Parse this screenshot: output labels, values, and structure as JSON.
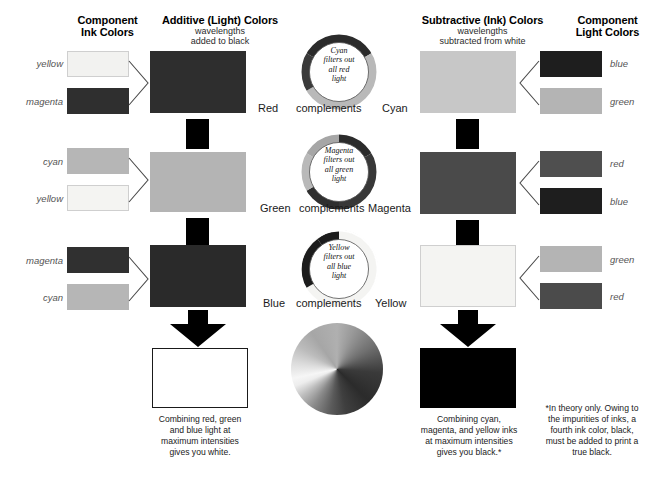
{
  "diagram": {
    "note": "grayscale reproduction"
  },
  "headers": {
    "left_col": {
      "line1": "Component",
      "line2": "Ink Colors"
    },
    "additive": {
      "line1": "Additive (Light) Colors",
      "line2": "wavelengths",
      "line3": "added to black"
    },
    "subtractive": {
      "line1": "Subtractive (Ink) Colors",
      "line2": "wavelengths",
      "line3": "subtracted from white"
    },
    "right_col": {
      "line1": "Component",
      "line2": "Light Colors"
    }
  },
  "left_groups": [
    {
      "name": "red-group",
      "inputs": [
        {
          "label": "yellow",
          "hex": "#f2f2f0"
        },
        {
          "label": "magenta",
          "hex": "#2f2f2f"
        }
      ],
      "result": {
        "label": "Red",
        "hex": "#2e2e2e"
      }
    },
    {
      "name": "green-group",
      "inputs": [
        {
          "label": "cyan",
          "hex": "#b6b6b6"
        },
        {
          "label": "yellow",
          "hex": "#f4f4f2"
        }
      ],
      "result": {
        "label": "Green",
        "hex": "#b4b4b4"
      }
    },
    {
      "name": "blue-group",
      "inputs": [
        {
          "label": "magenta",
          "hex": "#303030"
        },
        {
          "label": "cyan",
          "hex": "#b6b6b6"
        }
      ],
      "result": {
        "label": "Blue",
        "hex": "#2a2a2a"
      }
    }
  ],
  "right_groups": [
    {
      "name": "cyan-group",
      "result": {
        "label": "Cyan",
        "hex": "#c7c7c7"
      },
      "outputs": [
        {
          "label": "blue",
          "hex": "#1e1e1e"
        },
        {
          "label": "green",
          "hex": "#b4b4b4"
        }
      ]
    },
    {
      "name": "magenta-group",
      "result": {
        "label": "Magenta",
        "hex": "#4a4a4a"
      },
      "outputs": [
        {
          "label": "red",
          "hex": "#4f4f4f"
        },
        {
          "label": "blue",
          "hex": "#1e1e1e"
        }
      ]
    },
    {
      "name": "yellow-group",
      "result": {
        "label": "Yellow",
        "hex": "#f4f4f2"
      },
      "outputs": [
        {
          "label": "green",
          "hex": "#b4b4b4"
        },
        {
          "label": "red",
          "hex": "#4b4b4b"
        }
      ]
    }
  ],
  "plus_signs": {
    "symbol": "+",
    "count": 4
  },
  "wheels": [
    {
      "name": "cyan-wheel",
      "text": [
        "Cyan",
        "filters out",
        "all red",
        "light"
      ],
      "left_label": "Red",
      "mid_label": "complements",
      "right_label": "Cyan",
      "segments": [
        {
          "hex": "#2b2b2b",
          "start": 300,
          "end": 60
        },
        {
          "hex": "#b9b9b9",
          "start": 60,
          "end": 180
        },
        {
          "hex": "#3a3a3a",
          "start": 180,
          "end": 240
        },
        {
          "hex": "#a8a8a8",
          "start": 240,
          "end": 300
        }
      ]
    },
    {
      "name": "magenta-wheel",
      "text": [
        "Magenta",
        "filters out",
        "all green",
        "light"
      ],
      "left_label": "Green",
      "mid_label": "complements",
      "right_label": "Magenta",
      "segments": [
        {
          "hex": "#2b2b2b",
          "start": 300,
          "end": 60
        },
        {
          "hex": "#383838",
          "start": 60,
          "end": 180
        },
        {
          "hex": "#b9b9b9",
          "start": 180,
          "end": 240
        },
        {
          "hex": "#a0a0a0",
          "start": 240,
          "end": 300
        }
      ]
    },
    {
      "name": "yellow-wheel",
      "text": [
        "Yellow",
        "filters out",
        "all blue",
        "light"
      ],
      "left_label": "Blue",
      "mid_label": "complements",
      "right_label": "Yellow",
      "segments": [
        {
          "hex": "#f2f2f0",
          "start": 300,
          "end": 60
        },
        {
          "hex": "#efefed",
          "start": 60,
          "end": 180
        },
        {
          "hex": "#f5f5f3",
          "start": 180,
          "end": 215
        },
        {
          "hex": "#1c1c1c",
          "start": 215,
          "end": 300
        }
      ]
    }
  ],
  "color_disc": {
    "name": "color-wheel-disc",
    "type": "conic-gradient-grayscale",
    "stops": [
      "#b0b0b0",
      "#6f6f6f",
      "#2b2b2b",
      "#555555",
      "#8f8f8f",
      "#f2f2f2",
      "#cfcfcf",
      "#9a9a9a",
      "#b0b0b0"
    ]
  },
  "results": {
    "white_box": {
      "hex": "#ffffff",
      "has_border": true
    },
    "black_box": {
      "hex": "#000000",
      "has_border": false
    }
  },
  "captions": {
    "additive_result": "Combining red, green\nand blue light at\nmaximum intensities\ngives you white.",
    "subtractive_result": "Combining cyan,\nmagenta, and yellow inks\nat maximum intensities\ngives you black.*",
    "footnote": "*In theory only. Owing to\nthe impurities of inks, a\nfourth ink color, black,\nmust be added to print a\ntrue black."
  }
}
